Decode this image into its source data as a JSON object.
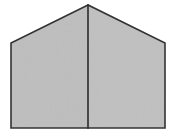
{
  "figure": {
    "background_color": "#ffffff",
    "fill_color": "#bebebe",
    "fill_color_alt": "#c3c3c3",
    "stroke_color": "#333333",
    "stroke_width": 1.6,
    "divider_color": "#2b2b2b",
    "divider_width": 1.6,
    "canvas": {
      "width": 175,
      "height": 138
    },
    "vertices": {
      "apex": {
        "x": 88,
        "y": 5
      },
      "left_shoulder": {
        "x": 11,
        "y": 43
      },
      "left_bottom": {
        "x": 11,
        "y": 128
      },
      "right_bottom": {
        "x": 165,
        "y": 128
      },
      "right_shoulder": {
        "x": 165,
        "y": 43
      }
    },
    "outline_path": "M 88 5 L 11 43 L 11 128 L 165 128 L 165 43 Z",
    "left_face_path": "M 88 5 L 11 43 L 11 128 L 88 128 Z",
    "right_face_path": "M 88 5 L 165 43 L 165 128 L 88 128 Z",
    "divider_path": "M 88 5 L 88 128",
    "labels": {
      "apex": "apex",
      "left_face": "left face",
      "right_face": "right face",
      "divider": "center divider",
      "base": "base edge"
    },
    "texture": {
      "enabled": true,
      "type": "noise",
      "opacity": 0.16
    }
  }
}
